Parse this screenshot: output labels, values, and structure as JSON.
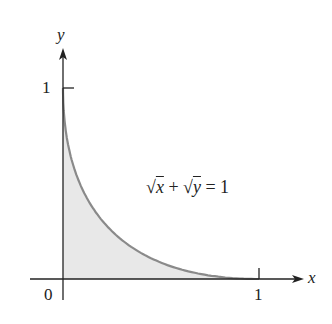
{
  "figure": {
    "axis_labels": {
      "x": "x",
      "y": "y"
    },
    "ticks": {
      "origin": "0",
      "x_one": "1",
      "y_one": "1"
    },
    "equation": {
      "sqrt1": "√",
      "var1": "x",
      "plus": "+",
      "sqrt2": "√",
      "var2": "y",
      "equals": "= 1"
    },
    "colors": {
      "curve": "#8a8a8a",
      "fill": "#e6e6e6",
      "axis": "#222222"
    }
  },
  "chart_data": {
    "type": "area",
    "title": "",
    "equation": "√x + √y = 1",
    "xlabel": "x",
    "ylabel": "y",
    "x": [
      0,
      0.05,
      0.1,
      0.2,
      0.3,
      0.4,
      0.5,
      0.6,
      0.7,
      0.8,
      0.9,
      1.0
    ],
    "y": [
      1,
      0.603,
      0.468,
      0.306,
      0.205,
      0.135,
      0.086,
      0.051,
      0.026,
      0.011,
      0.003,
      0
    ],
    "xlim": [
      0,
      1
    ],
    "ylim": [
      0,
      1
    ],
    "x_ticks": [
      "0",
      "1"
    ],
    "y_ticks": [
      "1"
    ],
    "shaded_region": "area under curve from x=0 to x=1",
    "grid": false
  }
}
